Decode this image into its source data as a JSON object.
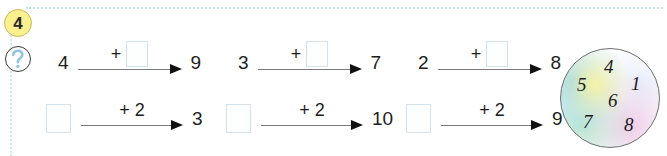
{
  "exercise": {
    "number": "4",
    "hint_icon": "question-mark-icon"
  },
  "colors": {
    "badge_fill": "#fbf08f",
    "badge_border": "#c9bc52",
    "box_border": "#cfe4ee",
    "dotted_rule": "#bfe3e8",
    "arrow": "#7b7b7b",
    "text": "#1d1d1d"
  },
  "problems": [
    {
      "id": "p1",
      "start": "4",
      "operator": "+",
      "operand": "",
      "operand_is_blank": true,
      "result": "9",
      "start_is_blank": false
    },
    {
      "id": "p2",
      "start": "3",
      "operator": "+",
      "operand": "",
      "operand_is_blank": true,
      "result": "7",
      "start_is_blank": false
    },
    {
      "id": "p3",
      "start": "2",
      "operator": "+",
      "operand": "",
      "operand_is_blank": true,
      "result": "8",
      "start_is_blank": false
    },
    {
      "id": "p4",
      "start": "",
      "operator": "+",
      "operand": "2",
      "operand_is_blank": false,
      "result": "3",
      "start_is_blank": true
    },
    {
      "id": "p5",
      "start": "",
      "operator": "+",
      "operand": "2",
      "operand_is_blank": false,
      "result": "10",
      "start_is_blank": true
    },
    {
      "id": "p6",
      "start": "",
      "operator": "+",
      "operand": "2",
      "operand_is_blank": false,
      "result": "9",
      "start_is_blank": true
    }
  ],
  "number_bubble": {
    "name": "number-choices-bubble",
    "numbers": [
      {
        "value": "4",
        "x": 44,
        "y": 9
      },
      {
        "value": "5",
        "x": 17,
        "y": 27
      },
      {
        "value": "1",
        "x": 71,
        "y": 26
      },
      {
        "value": "6",
        "x": 48,
        "y": 43
      },
      {
        "value": "7",
        "x": 23,
        "y": 64
      },
      {
        "value": "8",
        "x": 64,
        "y": 67
      }
    ]
  }
}
